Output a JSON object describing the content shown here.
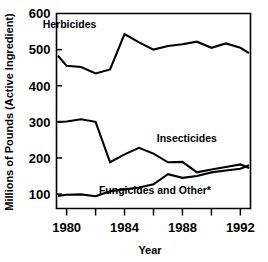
{
  "chart_data": {
    "type": "line",
    "title": "",
    "xlabel": "Year",
    "ylabel": "Millions of Pounds (Active Ingredient)",
    "xlim": [
      1979.3,
      1992.7
    ],
    "ylim": [
      60,
      600
    ],
    "ytick_values": [
      100,
      200,
      300,
      400,
      500,
      600
    ],
    "ytick_labels": [
      "100",
      "200",
      "300",
      "400",
      "500",
      "600"
    ],
    "xtick_values": [
      1980,
      1981,
      1982,
      1983,
      1984,
      1985,
      1986,
      1987,
      1988,
      1989,
      1990,
      1991,
      1992
    ],
    "xtick_labeled": [
      1980,
      1984,
      1988,
      1992
    ],
    "xtick_labels": [
      "1980",
      "1984",
      "1988",
      "1992"
    ],
    "grid": false,
    "legend_position": "inline-annotations",
    "x": [
      1979.4,
      1980,
      1981,
      1982,
      1983,
      1984,
      1985,
      1986,
      1987,
      1988,
      1989,
      1990,
      1991,
      1992,
      1992.6
    ],
    "series": [
      {
        "name": "Herbicides",
        "label_x": 1980.2,
        "label_y": 560,
        "values": [
          483,
          455,
          452,
          434,
          445,
          543,
          520,
          500,
          510,
          515,
          522,
          505,
          517,
          505,
          490
        ]
      },
      {
        "name": "Insecticides",
        "label_x": 1988.3,
        "label_y": 243,
        "values": [
          300,
          301,
          307,
          300,
          188,
          210,
          228,
          212,
          188,
          189,
          160,
          168,
          175,
          182,
          172
        ]
      },
      {
        "name": "Fungicides and Other*",
        "label_x": 1986.1,
        "label_y": 100,
        "values": [
          95,
          98,
          99,
          94,
          108,
          113,
          118,
          127,
          155,
          145,
          150,
          160,
          165,
          170,
          180
        ]
      }
    ]
  },
  "figure": {
    "ylabel": "Millions of Pounds (Active Ingredient)",
    "xlabel": "Year"
  }
}
